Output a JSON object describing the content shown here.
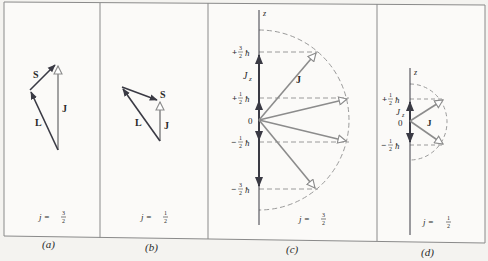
{
  "figure": {
    "panels": [
      {
        "id": "a",
        "caption": "(a)",
        "j_label": "j =",
        "j_num": "3",
        "j_den": "2",
        "vectors": {
          "S": "S",
          "L": "L",
          "J": "J"
        }
      },
      {
        "id": "b",
        "caption": "(b)",
        "j_label": "j =",
        "j_num": "1",
        "j_den": "2",
        "vectors": {
          "S": "S",
          "L": "L",
          "J": "J"
        }
      },
      {
        "id": "c",
        "caption": "(c)",
        "j_label": "j =",
        "j_num": "3",
        "j_den": "2",
        "axis_label": "z",
        "component_label": "J",
        "component_sub": "z",
        "vector_label": "J",
        "origin_label": "0",
        "levels": [
          {
            "sign": "+",
            "num": "3",
            "den": "2",
            "unit": "ħ"
          },
          {
            "sign": "+",
            "num": "1",
            "den": "2",
            "unit": "ħ"
          },
          {
            "sign": "−",
            "num": "1",
            "den": "2",
            "unit": "ħ"
          },
          {
            "sign": "−",
            "num": "3",
            "den": "2",
            "unit": "ħ"
          }
        ]
      },
      {
        "id": "d",
        "caption": "(d)",
        "j_label": "j =",
        "j_num": "1",
        "j_den": "2",
        "axis_label": "z",
        "component_label": "J",
        "component_sub": "z",
        "vector_label": "J",
        "origin_label": "0",
        "levels": [
          {
            "sign": "+",
            "num": "1",
            "den": "2",
            "unit": "ħ"
          },
          {
            "sign": "−",
            "num": "1",
            "den": "2",
            "unit": "ħ"
          }
        ]
      }
    ],
    "colors": {
      "background": "#f4f3f0",
      "frame": "#8a8a8a",
      "dark_vector": "#3a3a44",
      "gray_vector": "#8c8c8c",
      "dashed": "#9a9a9a",
      "text": "#2a2a2a"
    }
  }
}
